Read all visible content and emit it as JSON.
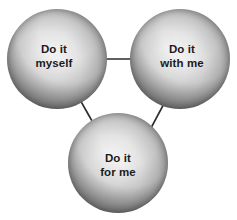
{
  "diagram": {
    "type": "node-link-triangle",
    "background_color": "#ffffff",
    "text_color": "#1b1b1b",
    "connector_color": "#2b2b2b",
    "nodes": [
      {
        "id": "do-it-myself",
        "label": "Do it\nmyself",
        "line1": "Do it",
        "line2": "myself",
        "shape": "sphere",
        "center_x": 57,
        "center_y": 59,
        "diameter": 100
      },
      {
        "id": "do-it-with-me",
        "label": "Do it\nwith me",
        "line1": "Do it",
        "line2": "with me",
        "shape": "sphere",
        "center_x": 180,
        "center_y": 59,
        "diameter": 100
      },
      {
        "id": "do-it-for-me",
        "label": "Do it\nfor me",
        "line1": "Do it",
        "line2": "for me",
        "shape": "sphere",
        "center_x": 118,
        "center_y": 163,
        "diameter": 100
      }
    ],
    "connectors": [
      {
        "id": "myself-to-with-me",
        "from": "do-it-myself",
        "to": "do-it-with-me",
        "x1": 104,
        "y1": 59,
        "x2": 141,
        "y2": 59
      },
      {
        "id": "myself-to-for-me",
        "from": "do-it-myself",
        "to": "do-it-for-me",
        "x1": 79,
        "y1": 98,
        "x2": 96,
        "y2": 128
      },
      {
        "id": "with-me-to-for-me",
        "from": "do-it-with-me",
        "to": "do-it-for-me",
        "x1": 167,
        "y1": 98,
        "x2": 151,
        "y2": 128
      }
    ]
  }
}
